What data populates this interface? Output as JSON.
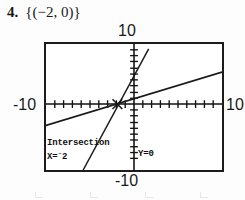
{
  "answer": {
    "number": "4.",
    "value": "{(−2, 0)}"
  },
  "graph": {
    "labels": {
      "top": "10",
      "bottom": "-10",
      "left": "-10",
      "right": "10"
    },
    "readout": {
      "title": "Intersection",
      "x_prefix": "X=",
      "x_sign": "⁻",
      "x_value": "2",
      "y_text": "Y=0"
    }
  },
  "chart_data": {
    "type": "line",
    "xlabel": "",
    "ylabel": "",
    "xlim": [
      -10,
      10
    ],
    "ylim": [
      -10,
      10
    ],
    "grid": false,
    "axis_ticks": true,
    "tick_spacing": 1,
    "legend": "none",
    "series": [
      {
        "name": "steep-line",
        "style": "solid",
        "points": [
          [
            -5.6,
            -10
          ],
          [
            -2,
            0
          ],
          [
            0,
            5.4
          ],
          [
            1.6,
            10
          ]
        ]
      },
      {
        "name": "shallow-line",
        "style": "solid",
        "points": [
          [
            -10,
            -3.4
          ],
          [
            -2,
            0
          ],
          [
            0,
            0.85
          ],
          [
            10,
            5.1
          ]
        ]
      }
    ],
    "annotations": [
      {
        "name": "intersection-point",
        "x": -2,
        "y": 0,
        "label": "Intersection X=-2 Y=0"
      }
    ]
  },
  "bleed_marks": {
    "count": 4,
    "positions": [
      35,
      90,
      145,
      200
    ]
  }
}
